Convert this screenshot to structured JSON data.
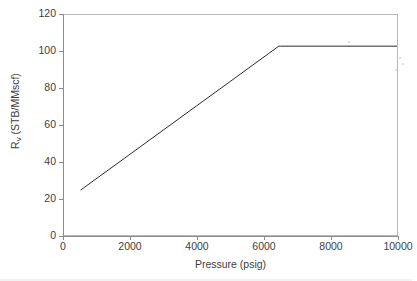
{
  "chart_data": {
    "type": "line",
    "title": "",
    "xlabel": "Pressure (psig)",
    "ylabel": "Rv (STB/MMscf)",
    "ylabel_main": "R",
    "ylabel_sub": "v",
    "ylabel_units": " (STB/MMscf)",
    "xlim": [
      0,
      10000
    ],
    "ylim": [
      0,
      120
    ],
    "xticks": [
      0,
      2000,
      4000,
      6000,
      8000,
      10000
    ],
    "xtick_labels": [
      "0",
      "2000",
      "4000",
      "6000",
      "8000",
      "10000"
    ],
    "yticks": [
      0,
      20,
      40,
      60,
      80,
      100,
      120
    ],
    "ytick_labels": [
      "0",
      "20",
      "40",
      "60",
      "80",
      "100",
      "120"
    ],
    "grid": false,
    "legend": false,
    "line_color": "#2b2b2b",
    "line_width": 1,
    "series": [
      {
        "name": "Rv vs Pressure",
        "x": [
          500,
          6450,
          6500,
          10000
        ],
        "y": [
          24.5,
          103.0,
          103.0,
          103.0
        ]
      }
    ],
    "annotations": []
  },
  "marks": {
    "watermark_text": "",
    "specks": [
      {
        "x": 348,
        "y": 41
      },
      {
        "x": 399,
        "y": 57
      },
      {
        "x": 402,
        "y": 63
      },
      {
        "x": 395,
        "y": 69
      }
    ]
  }
}
